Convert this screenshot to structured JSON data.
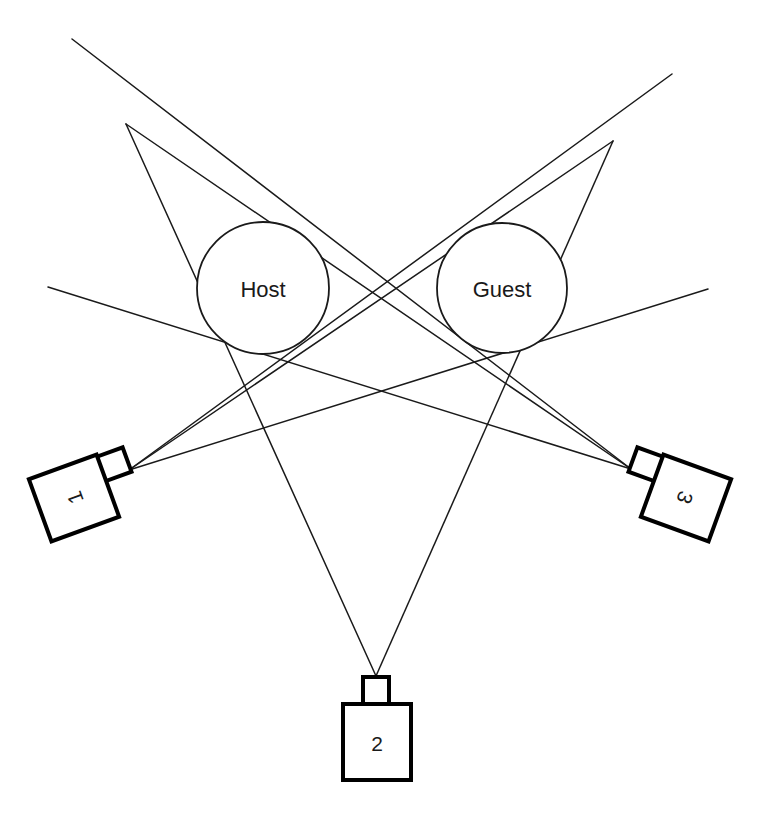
{
  "diagram": {
    "background_color": "#ffffff",
    "line_color": "#1a1a1a",
    "camera_outline_color": "#000000",
    "subjects": [
      {
        "id": "host",
        "label": "Host",
        "cx": 263,
        "cy": 288,
        "r": 66
      },
      {
        "id": "guest",
        "label": "Guest",
        "cx": 502,
        "cy": 288,
        "r": 65
      }
    ],
    "cameras": [
      {
        "id": "camera-1",
        "label": "1",
        "label_rotation": -90,
        "body_rotation": -20,
        "body_cx": 74,
        "body_cy": 498,
        "body_w": 72,
        "body_h": 66,
        "lens_cx": 122,
        "lens_cy": 480,
        "lens_w": 30,
        "lens_h": 26,
        "focal_x": 129,
        "focal_y": 470
      },
      {
        "id": "camera-2",
        "label": "2",
        "label_rotation": 0,
        "body_rotation": 0,
        "body_cx": 377,
        "body_cy": 742,
        "body_w": 68,
        "body_h": 76,
        "lens_cx": 376,
        "lens_cy": 692,
        "lens_w": 26,
        "lens_h": 30,
        "focal_x": 376,
        "focal_y": 676
      },
      {
        "id": "camera-3",
        "label": "3",
        "label_rotation": 90,
        "body_rotation": 20,
        "body_cx": 686,
        "body_cy": 498,
        "body_w": 72,
        "body_h": 66,
        "lens_cx": 638,
        "lens_cy": 480,
        "lens_w": 30,
        "lens_h": 26,
        "focal_x": 631,
        "focal_y": 469
      }
    ],
    "sight_lines": [
      {
        "id": "cam1-edge-a",
        "from": "camera-1",
        "x1": 129,
        "y1": 470,
        "x2": 672,
        "y2": 74
      },
      {
        "id": "cam1-edge-b",
        "from": "camera-1",
        "x1": 129,
        "y1": 470,
        "x2": 613,
        "y2": 141
      },
      {
        "id": "cam1-edge-c",
        "from": "camera-1",
        "x1": 129,
        "y1": 470,
        "x2": 708,
        "y2": 289
      },
      {
        "id": "cam2-edge-a",
        "from": "camera-2",
        "x1": 376,
        "y1": 676,
        "x2": 126,
        "y2": 124
      },
      {
        "id": "cam2-edge-b",
        "from": "camera-2",
        "x1": 376,
        "y1": 676,
        "x2": 613,
        "y2": 141
      },
      {
        "id": "cam3-edge-a",
        "from": "camera-3",
        "x1": 631,
        "y1": 469,
        "x2": 72,
        "y2": 39
      },
      {
        "id": "cam3-edge-b",
        "from": "camera-3",
        "x1": 631,
        "y1": 469,
        "x2": 126,
        "y2": 124
      },
      {
        "id": "cam3-edge-c",
        "from": "camera-3",
        "x1": 631,
        "y1": 469,
        "x2": 48,
        "y2": 287
      }
    ]
  }
}
